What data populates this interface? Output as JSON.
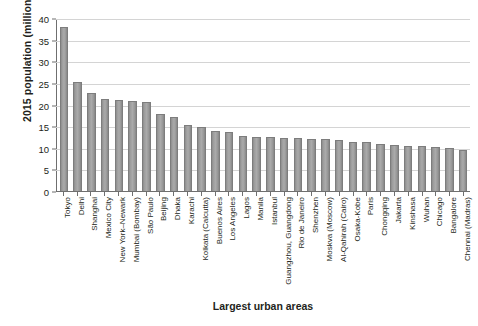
{
  "chart_data": {
    "type": "bar",
    "title": "",
    "subtitle": "",
    "xlabel": "Largest urban areas",
    "ylabel": "2015 population (millions)",
    "ylim": [
      0,
      40
    ],
    "yticks": [
      0,
      5,
      10,
      15,
      20,
      25,
      30,
      35,
      40
    ],
    "grid": true,
    "legend": false,
    "legend_position": "none",
    "bar_color": "#a3a3a3",
    "bar_edge_color": "#7d7d7d",
    "gridline_color": "#d4d4d4",
    "axis_color": "#6f6f6f",
    "text_color": "#231f20",
    "categories": [
      "Tokyo",
      "Delhi",
      "Shanghai",
      "Mexico City",
      "New York–Newark",
      "Mumbai (Bombay)",
      "São Paulo",
      "Beijing",
      "Dhaka",
      "Karachi",
      "Kolkata (Calcutta)",
      "Buenos Aires",
      "Los Angeles",
      "Lagos",
      "Manila",
      "Istanbul",
      "Guangzhou, Guangdong",
      "Rio de Janeiro",
      "Shenzhen",
      "Moskva (Moscow)",
      "Al-Qahirah (Cairo)",
      "Osaka-Kobe",
      "Paris",
      "Chongqing",
      "Jakarta",
      "Kinshasa",
      "Wuhan",
      "Chicago",
      "Bangalore",
      "Chennai (Madras)"
    ],
    "values": [
      38.2,
      25.4,
      22.8,
      21.4,
      21.1,
      21.0,
      20.7,
      17.8,
      17.1,
      15.3,
      14.9,
      13.9,
      13.8,
      12.8,
      12.6,
      12.5,
      12.4,
      12.3,
      12.2,
      12.1,
      11.8,
      11.5,
      11.3,
      10.9,
      10.6,
      10.5,
      10.4,
      10.2,
      9.9,
      9.5
    ],
    "units": "millions",
    "year": 2015
  }
}
